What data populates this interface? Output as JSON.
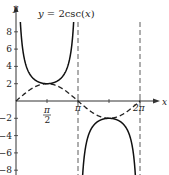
{
  "chart_data": {
    "type": "line",
    "title": "y = 2csc(x)",
    "xlabel": "x",
    "ylabel": "y",
    "xlim": [
      0,
      7.0
    ],
    "ylim": [
      -9,
      9
    ],
    "x_ticks": [
      "π/2",
      "π",
      "2π"
    ],
    "x_tick_values": [
      1.5708,
      3.1416,
      6.2832
    ],
    "y_ticks": [
      -8,
      -6,
      -4,
      -2,
      2,
      4,
      6,
      8
    ],
    "asymptotes": [
      3.1416,
      6.2832
    ],
    "series": [
      {
        "name": "y = 2csc(x)",
        "style": "solid",
        "function": "2/sin(x)"
      },
      {
        "name": "y = 2sin(x)",
        "style": "dashed",
        "function": "2*sin(x)"
      }
    ],
    "key_points": [
      {
        "x": 1.5708,
        "y": 2,
        "label": "local min of 2csc(x)"
      },
      {
        "x": 4.7124,
        "y": -2,
        "label": "local max of 2csc(x)"
      }
    ],
    "grid": false
  },
  "labels": {
    "title": "y = 2csc(x)",
    "x_axis": "x",
    "y_axis": "y",
    "pi_half_num": "π",
    "pi_half_den": "2",
    "pi": "π",
    "two_pi": "2π",
    "y_tick_labels": [
      "8",
      "6",
      "4",
      "2",
      "−2",
      "−4",
      "−6",
      "−8"
    ]
  }
}
